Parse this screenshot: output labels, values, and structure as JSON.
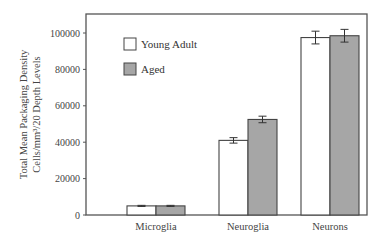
{
  "chart_data": {
    "type": "bar",
    "title": "",
    "xlabel": "",
    "ylabel_lines": [
      "Total Mean Packaging Density",
      "Cells/mm³/20 Depth Levels"
    ],
    "ylabel": "Total Mean Packaging Density Cells/mm³/20 Depth Levels",
    "ylim": [
      0,
      110000
    ],
    "yticks": [
      0,
      20000,
      40000,
      60000,
      80000,
      100000
    ],
    "categories": [
      "Microglia",
      "Neuroglia",
      "Neurons"
    ],
    "series": [
      {
        "name": "Young Adult",
        "color": "#ffffff",
        "values": [
          5000,
          41000,
          97500
        ],
        "errors": [
          300,
          1500,
          3500
        ]
      },
      {
        "name": "Aged",
        "color": "#a6a6a6",
        "values": [
          5000,
          52500,
          98500
        ],
        "errors": [
          300,
          1800,
          3500
        ]
      }
    ],
    "legend": {
      "position": "upper-left",
      "entries": [
        "Young Adult",
        "Aged"
      ]
    },
    "grid": false
  }
}
